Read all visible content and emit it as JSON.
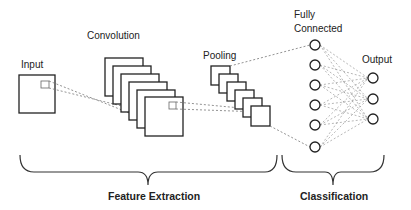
{
  "labels": {
    "input": "Input",
    "convolution": "Convolution",
    "pooling": "Pooling",
    "fully_connected_line1": "Fully",
    "fully_connected_line2": "Connected",
    "output": "Output",
    "feature_extraction": "Feature Extraction",
    "classification": "Classification"
  },
  "colors": {
    "stroke": "#222222",
    "dashed": "#777777",
    "background": "#ffffff"
  },
  "structure": {
    "conv_maps": 6,
    "pool_maps": 6,
    "fc_nodes": 6,
    "output_nodes": 3
  }
}
